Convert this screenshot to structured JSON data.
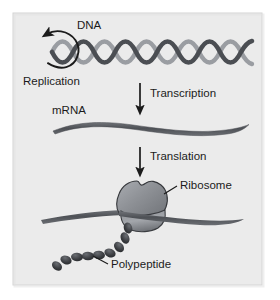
{
  "figure": {
    "panel_background": "#ebebeb",
    "panel_border": "#d2d2d2",
    "outer_background": "#ffffff",
    "ink_color": "#1b1b1b",
    "strand_color": "#55585d",
    "strand_highlight": "#8d9095",
    "ribosome_fill": "#8b8e93",
    "ribosome_edge": "#2f3134"
  },
  "labels": {
    "dna": "DNA",
    "replication": "Replication",
    "transcription": "Transcription",
    "mrna": "mRNA",
    "translation": "Translation",
    "ribosome": "Ribosome",
    "polypeptide": "Polypeptide"
  },
  "stages": [
    {
      "name": "replication",
      "molecule": "DNA",
      "process_label": "Replication",
      "description": "Double helix with circular replication arrow"
    },
    {
      "name": "transcription",
      "molecule": "mRNA",
      "process_label": "Transcription",
      "description": "Single wavy mRNA strand produced from DNA"
    },
    {
      "name": "translation",
      "molecule": "Polypeptide",
      "process_label": "Translation",
      "description": "Ribosome on mRNA producing polypeptide bead chain"
    }
  ],
  "icons": {
    "replication_arrow": "circular-arrow-icon",
    "transcription_arrow": "down-arrow-icon",
    "translation_arrow": "down-arrow-icon",
    "dna_helix": "dna-double-helix-icon",
    "mrna_strand": "mrna-strand-icon",
    "ribosome": "ribosome-icon",
    "polypeptide": "polypeptide-chain-icon"
  },
  "geometry": {
    "polypeptide_bead_count": 9,
    "dna_helix_turns": 7
  }
}
